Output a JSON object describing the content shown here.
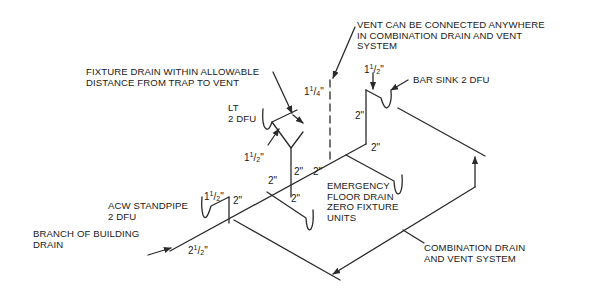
{
  "labels": {
    "vent_note": "VENT CAN BE CONNECTED ANYWHERE\nIN COMBINATION DRAIN AND VENT\nSYSTEM",
    "fixture_drain_note": "FIXTURE DRAIN WITHIN ALLOWABLE\nDISTANCE FROM TRAP TO VENT",
    "lt": "LT\n2 DFU",
    "bar_sink": "BAR SINK 2 DFU",
    "acw_standpipe": "ACW STANDPIPE\n2 DFU",
    "branch_drain": "BRANCH OF BUILDING\nDRAIN",
    "emergency_floor_drain": "EMERGENCY\nFLOOR DRAIN\nZERO FIXTURE\nUNITS",
    "combination_system": "COMBINATION DRAIN\nAND VENT SYSTEM"
  },
  "dimensions": {
    "vent_size": {
      "whole": "1",
      "num": "1",
      "den": "4"
    },
    "bar_sink_arm": {
      "whole": "1",
      "num": "1",
      "den": "2"
    },
    "lt_arm": {
      "whole": "1",
      "num": "1",
      "den": "2"
    },
    "acw_arm": {
      "whole": "1",
      "num": "1",
      "den": "2"
    },
    "building_drain": {
      "whole": "2",
      "num": "1",
      "den": "2"
    },
    "bar_sink_riser": "2\"",
    "lt_riser": "2\"",
    "acw_riser": "2\"",
    "main_upper": "2\"",
    "main_mid": "2\"",
    "main_lower": "2\"",
    "floor_drain_branch": "2\"",
    "upper_branch": "2\"",
    "inch_mark": "\""
  },
  "colors": {
    "line": "#2a2a2a",
    "background": "#ffffff"
  }
}
